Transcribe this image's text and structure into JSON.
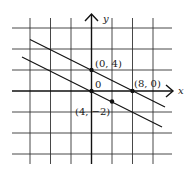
{
  "figure": {
    "axes": {
      "x_label": "x",
      "y_label": "y",
      "origin_label": "0"
    },
    "points": [
      {
        "label": "(0, 4)",
        "x": 0,
        "y": 4
      },
      {
        "label": "(8, 0)",
        "x": 8,
        "y": 0
      },
      {
        "label": "(4, −2)",
        "x": 4,
        "y": -2
      },
      {
        "label": "",
        "x": 0,
        "y": 0
      }
    ],
    "lines": [
      {
        "name": "upper-line",
        "through": [
          "(0, 4)",
          "(8, 0)"
        ]
      },
      {
        "name": "lower-line",
        "through": [
          "(0, 0)",
          "(4, −2)"
        ]
      }
    ],
    "grid": {
      "units_per_cell": 4,
      "x_range": [
        -12,
        12
      ],
      "y_range": [
        -12,
        12
      ]
    }
  }
}
